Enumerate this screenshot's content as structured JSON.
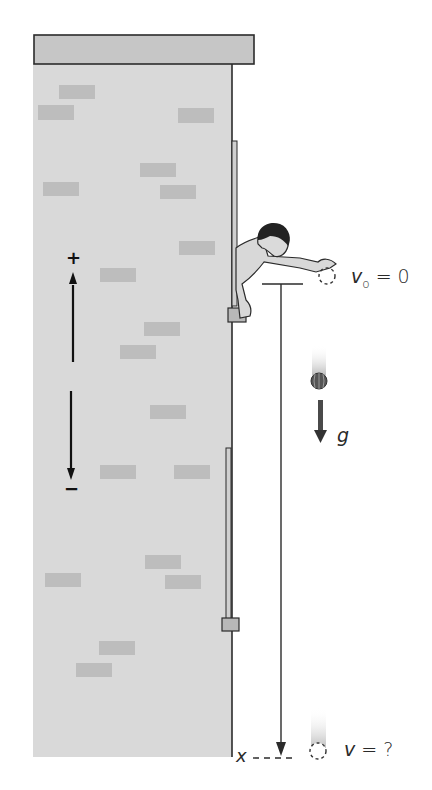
{
  "figure": {
    "colors": {
      "wall": "#d9d9d9",
      "roof": "#c6c6c6",
      "brick": "#bdbdbd",
      "outline": "#2b2b2b",
      "ball": "#555555",
      "arrow": "#4a4a4a",
      "trail": "#cfcfcf"
    }
  },
  "labels": {
    "initial_velocity_symbol": "v",
    "initial_velocity_subscript": "o",
    "initial_velocity_value": "= 0",
    "gravity": "g",
    "final_velocity_symbol": "v",
    "final_velocity_value": "= ?",
    "position": "x",
    "positive_direction": "+",
    "negative_direction": "−"
  },
  "bricks": [
    {
      "x": 59,
      "y": 85,
      "w": 36,
      "h": 14
    },
    {
      "x": 38,
      "y": 105,
      "w": 36,
      "h": 15
    },
    {
      "x": 178,
      "y": 108,
      "w": 36,
      "h": 15
    },
    {
      "x": 140,
      "y": 163,
      "w": 36,
      "h": 14
    },
    {
      "x": 43,
      "y": 182,
      "w": 36,
      "h": 14
    },
    {
      "x": 160,
      "y": 185,
      "w": 36,
      "h": 14
    },
    {
      "x": 179,
      "y": 241,
      "w": 36,
      "h": 14
    },
    {
      "x": 100,
      "y": 268,
      "w": 36,
      "h": 14
    },
    {
      "x": 144,
      "y": 322,
      "w": 36,
      "h": 14
    },
    {
      "x": 120,
      "y": 345,
      "w": 36,
      "h": 14
    },
    {
      "x": 150,
      "y": 405,
      "w": 36,
      "h": 14
    },
    {
      "x": 100,
      "y": 465,
      "w": 36,
      "h": 14
    },
    {
      "x": 174,
      "y": 465,
      "w": 36,
      "h": 14
    },
    {
      "x": 145,
      "y": 555,
      "w": 36,
      "h": 14
    },
    {
      "x": 45,
      "y": 573,
      "w": 36,
      "h": 14
    },
    {
      "x": 165,
      "y": 575,
      "w": 36,
      "h": 14
    },
    {
      "x": 99,
      "y": 641,
      "w": 36,
      "h": 14
    },
    {
      "x": 76,
      "y": 663,
      "w": 36,
      "h": 14
    }
  ]
}
